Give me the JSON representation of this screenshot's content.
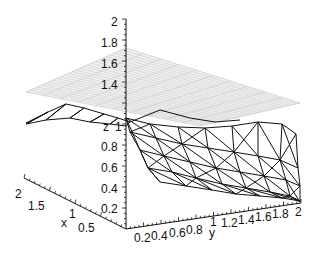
{
  "chart_data": {
    "type": "surface3d",
    "title": "",
    "axes": {
      "x": {
        "label": "x",
        "ticks": [
          "0.5",
          "1",
          "1.5",
          "2"
        ],
        "range": [
          0,
          2
        ]
      },
      "y": {
        "label": "y",
        "ticks": [
          "0.2",
          "0.4",
          "0.6",
          "0.8",
          "1",
          "1.2",
          "1.4",
          "1.6",
          "1.8",
          "2"
        ],
        "range": [
          0,
          2
        ]
      },
      "z": {
        "label": "z",
        "ticks": [
          "0.2",
          "0.4",
          "0.6",
          "0.8",
          "1",
          "1.2",
          "1.4",
          "1.6",
          "1.8",
          "2"
        ],
        "range": [
          0,
          2
        ]
      }
    },
    "series": [
      {
        "name": "plane",
        "style": "light grey gridded plane",
        "z": 1.5
      },
      {
        "name": "surface",
        "style": "black triangulated wireframe",
        "z_range": [
          0.6,
          1.35
        ]
      }
    ],
    "grid": false,
    "legend": null
  },
  "axes": {
    "z_label": "z",
    "x_label": "x",
    "y_label": "y",
    "z_ticks": [
      "2",
      "1.8",
      "1.6",
      "1.4",
      "1",
      "0.8",
      "0.6",
      "0.4",
      "0.2"
    ],
    "y_ticks": [
      "0.2",
      "0.4",
      "0.6",
      "0.8",
      "1",
      "1.2",
      "1.4",
      "1.6",
      "1.8",
      "2"
    ],
    "x_ticks": [
      "2",
      "1.5",
      "1",
      "0.5"
    ]
  },
  "colors": {
    "axis": "#111111",
    "plane": "#b8b8b8",
    "mesh": "#111111"
  }
}
